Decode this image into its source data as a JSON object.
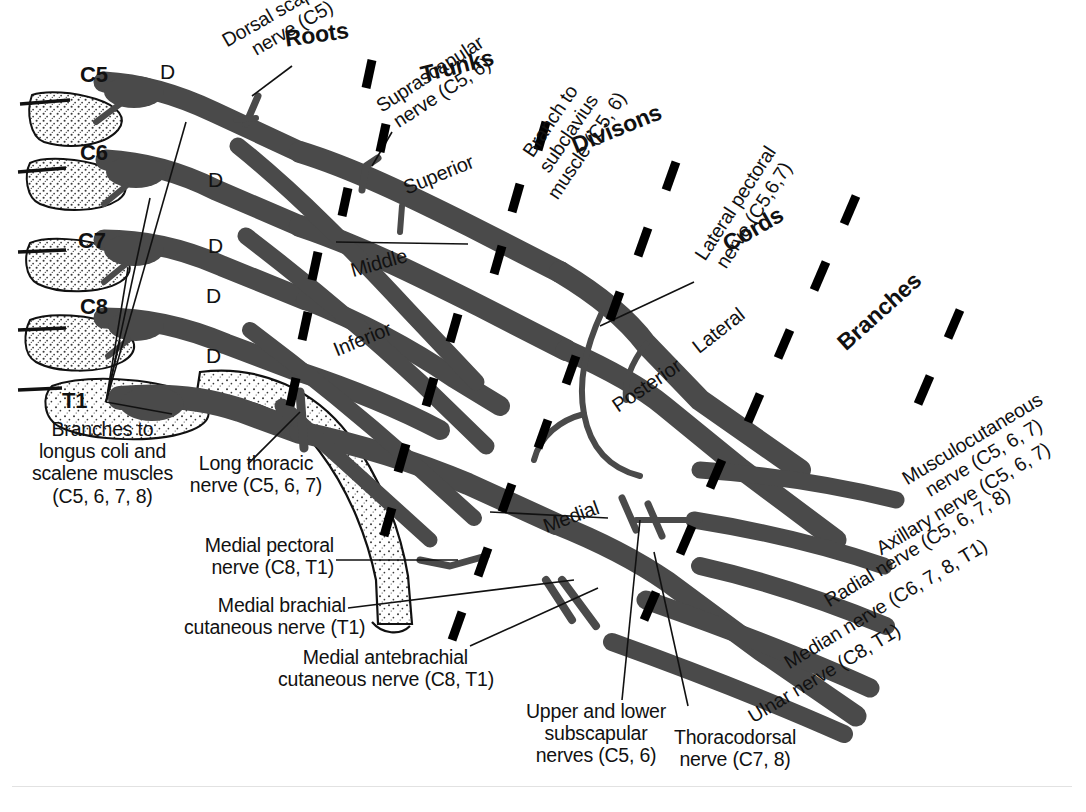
{
  "diagram": {
    "colors": {
      "nerve": "#4a4a4a",
      "outline": "#111111",
      "text": "#111111",
      "background": "#ffffff",
      "bone_fill": "#ffffff",
      "stipple": "#3a3a3a"
    }
  },
  "section_headings": [
    {
      "label": "Roots",
      "rotation": -8
    },
    {
      "label": "Trunks",
      "rotation": -14
    },
    {
      "label": "Divisons",
      "rotation": -22
    },
    {
      "label": "Cords",
      "rotation": -30
    },
    {
      "label": "Branches",
      "rotation": -42
    }
  ],
  "spinal_roots": [
    {
      "label": "C5"
    },
    {
      "label": "C6"
    },
    {
      "label": "C7"
    },
    {
      "label": "C8"
    },
    {
      "label": "T1"
    }
  ],
  "ganglion_markers": [
    {
      "label": "D"
    },
    {
      "label": "D"
    },
    {
      "label": "D"
    },
    {
      "label": "D"
    },
    {
      "label": "D"
    }
  ],
  "trunks": [
    {
      "label": "Superior",
      "rotation": -22
    },
    {
      "label": "Middle",
      "rotation": -16
    },
    {
      "label": "Inferior",
      "rotation": -22
    }
  ],
  "cords": [
    {
      "label": "Lateral",
      "rotation": -38
    },
    {
      "label": "Posterior",
      "rotation": -34
    },
    {
      "label": "Medial",
      "rotation": -20
    }
  ],
  "callouts_top": [
    {
      "label": "Dorsal scapular\nnerve (C5)",
      "rotation": -30
    },
    {
      "label": "Suprascapular\nnerve (C5, 6)",
      "rotation": -33
    },
    {
      "label": "Branch to\nsubclavius\nmuscle (C5, 6)",
      "rotation": -56
    },
    {
      "label": "Lateral pectoral\nnerve (C5,6,7)",
      "rotation": -57
    }
  ],
  "callouts_left": [
    {
      "label": "Branches to\nlongus coli and\nscalene muscles\n(C5, 6, 7, 8)"
    },
    {
      "label": "Long thoracic\nnerve (C5, 6, 7)"
    },
    {
      "label": "Medial pectoral\nnerve (C8, T1)"
    },
    {
      "label": "Medial brachial\ncutaneous nerve (T1)"
    },
    {
      "label": "Medial antebrachial\ncutaneous nerve (C8, T1)"
    }
  ],
  "callouts_bottom": [
    {
      "label": "Upper and lower\nsubscapular\nnerves (C5, 6)"
    },
    {
      "label": "Thoracodorsal\nnerve (C7, 8)"
    }
  ],
  "terminal_branches": [
    {
      "label": "Musculocutaneous\nnerve (C5, 6, 7)",
      "rotation": -31
    },
    {
      "label": "Axillary nerve (C5, 6, 7)",
      "rotation": -31
    },
    {
      "label": "Radial nerve (C5, 6, 7, 8)",
      "rotation": -31
    },
    {
      "label": "Median nerve (C6, 7, 8, T1)",
      "rotation": -31
    },
    {
      "label": "Ulnar nerve (C8, T1)",
      "rotation": -31
    }
  ]
}
